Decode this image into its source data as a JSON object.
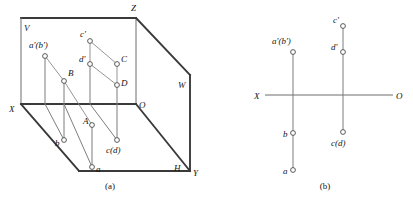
{
  "figure": {
    "captions": [
      {
        "id": "caption-a",
        "text": "(a)",
        "x": 110,
        "y": 189
      },
      {
        "id": "caption-b",
        "text": "(b)",
        "x": 325,
        "y": 189
      }
    ]
  },
  "pictorial": {
    "name": "three-plane-projection-box",
    "plane_labels": [
      {
        "id": "plane-v",
        "text": "V",
        "x": 24,
        "y": 31
      },
      {
        "id": "plane-w",
        "text": "W",
        "x": 178,
        "y": 88
      },
      {
        "id": "plane-h",
        "text": "H",
        "x": 174,
        "y": 171
      }
    ],
    "axis_labels": [
      {
        "id": "axis-x",
        "text": "X",
        "x": 9,
        "y": 112
      },
      {
        "id": "axis-y",
        "text": "Y",
        "x": 193,
        "y": 176
      },
      {
        "id": "axis-z",
        "text": "Z",
        "x": 131,
        "y": 11
      },
      {
        "id": "origin-o",
        "text": "O",
        "x": 139,
        "y": 108
      }
    ],
    "points": [
      {
        "id": "pt-a-prime-b-prime",
        "label": "a'(b')",
        "cx": 45,
        "cy": 56,
        "label_x": 29,
        "label_y": 48,
        "anchor": "start"
      },
      {
        "id": "pt-c-prime",
        "label": "c'",
        "cx": 90,
        "cy": 41,
        "label_x": 80,
        "label_y": 37,
        "anchor": "start"
      },
      {
        "id": "pt-d-prime",
        "label": "d'",
        "cx": 90,
        "cy": 64,
        "label_x": 79,
        "label_y": 62,
        "anchor": "start"
      },
      {
        "id": "pt-C",
        "label": "C",
        "cx": 117,
        "cy": 64,
        "label_x": 121,
        "label_y": 62,
        "anchor": "start"
      },
      {
        "id": "pt-D",
        "label": "D",
        "cx": 117,
        "cy": 85,
        "label_x": 121,
        "label_y": 86,
        "anchor": "start"
      },
      {
        "id": "pt-B",
        "label": "B",
        "cx": 64,
        "cy": 81,
        "label_x": 68,
        "label_y": 76,
        "anchor": "start"
      },
      {
        "id": "pt-A",
        "label": "A",
        "cx": 92,
        "cy": 125,
        "label_x": 83,
        "label_y": 124,
        "anchor": "start"
      },
      {
        "id": "pt-b",
        "label": "b",
        "cx": 64,
        "cy": 140,
        "label_x": 55,
        "label_y": 146,
        "anchor": "start"
      },
      {
        "id": "pt-a",
        "label": "a",
        "cx": 92,
        "cy": 167,
        "label_x": 96,
        "label_y": 172,
        "anchor": "start"
      },
      {
        "id": "pt-c-d",
        "label": "c(d)",
        "cx": 117,
        "cy": 140,
        "label_x": 106,
        "label_y": 153,
        "anchor": "start"
      }
    ]
  },
  "projection_view": {
    "name": "two-view-orthographic-projection",
    "axis_labels": [
      {
        "id": "proj-axis-x",
        "text": "X",
        "x": 254,
        "y": 99
      },
      {
        "id": "proj-origin-o",
        "text": "O",
        "x": 396,
        "y": 99
      }
    ],
    "points": [
      {
        "id": "proj-a-prime-b-prime",
        "label": "a'(b')",
        "cx": 293,
        "cy": 52,
        "label_x": 272,
        "label_y": 44,
        "anchor": "start"
      },
      {
        "id": "proj-c-prime",
        "label": "c'",
        "cx": 343,
        "cy": 26,
        "label_x": 333,
        "label_y": 23,
        "anchor": "start"
      },
      {
        "id": "proj-d-prime",
        "label": "d'",
        "cx": 343,
        "cy": 52,
        "label_x": 331,
        "label_y": 50,
        "anchor": "start"
      },
      {
        "id": "proj-b",
        "label": "b",
        "cx": 293,
        "cy": 133,
        "label_x": 283,
        "label_y": 137,
        "anchor": "start"
      },
      {
        "id": "proj-a",
        "label": "a",
        "cx": 293,
        "cy": 170,
        "label_x": 283,
        "label_y": 174,
        "anchor": "start"
      },
      {
        "id": "proj-c-d",
        "label": "c(d)",
        "cx": 343,
        "cy": 132,
        "label_x": 331,
        "label_y": 146,
        "anchor": "start"
      }
    ]
  }
}
